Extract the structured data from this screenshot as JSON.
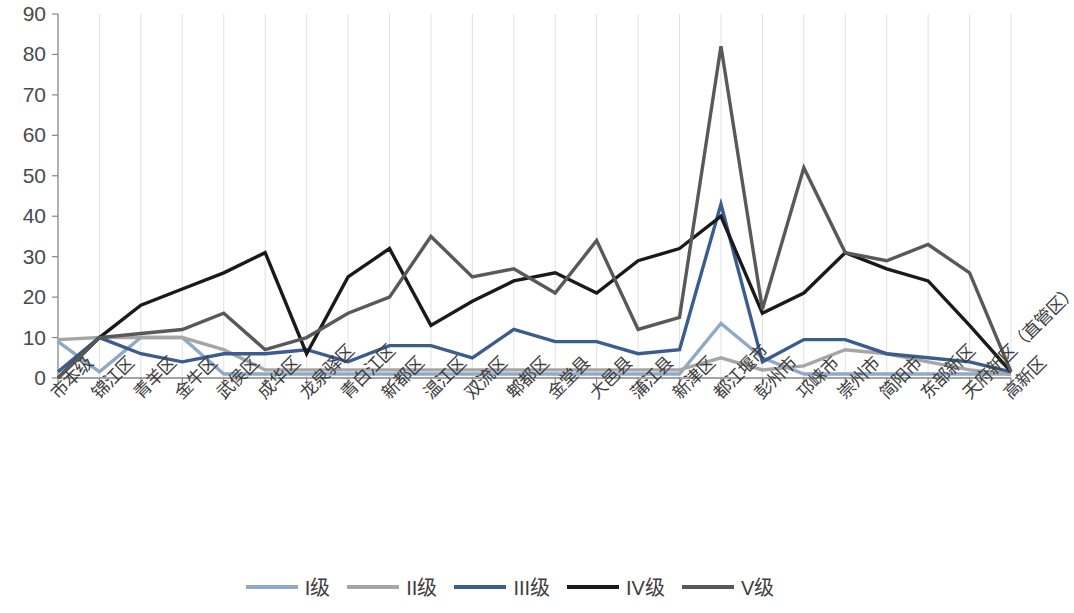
{
  "chart_data": {
    "type": "line",
    "title": "",
    "xlabel": "",
    "ylabel": "",
    "ylim": [
      0,
      90
    ],
    "yticks": [
      0,
      10,
      20,
      30,
      40,
      50,
      60,
      70,
      80,
      90
    ],
    "grid": "vertical-only",
    "legend_position": "bottom",
    "categories": [
      "市本级",
      "锦江区",
      "青羊区",
      "金牛区",
      "武侯区",
      "成华区",
      "龙泉驿区",
      "青白江区",
      "新都区",
      "温江区",
      "双流区",
      "郫都区",
      "金堂县",
      "大邑县",
      "蒲江县",
      "新津区",
      "都江堰市",
      "彭州市",
      "邛崃市",
      "崇州市",
      "简阳市",
      "东部新区",
      "天府新区（直管区）",
      "高新区"
    ],
    "series": [
      {
        "name": "I级",
        "color": "#8FA9C9",
        "values": [
          9,
          1.5,
          10,
          10,
          1,
          1,
          1,
          1,
          1,
          1,
          1,
          1,
          1,
          1,
          1,
          1,
          13.5,
          5,
          1,
          1,
          1,
          1,
          1,
          1
        ]
      },
      {
        "name": "II级",
        "color": "#A6A6A6",
        "values": [
          9.5,
          10,
          10,
          10,
          7,
          2,
          2,
          2,
          2,
          2,
          2,
          2,
          2,
          2,
          2,
          2,
          5,
          2,
          3,
          7,
          6,
          4,
          2,
          1
        ]
      },
      {
        "name": "III级",
        "color": "#3B5C8F",
        "values": [
          1.5,
          10,
          6,
          4,
          6,
          6,
          7,
          4,
          8,
          8,
          5,
          12,
          9,
          9,
          6,
          7,
          43,
          4,
          9.5,
          9.5,
          6,
          5,
          4,
          1.5
        ]
      },
      {
        "name": "IV级",
        "color": "#1A1A1A",
        "values": [
          0,
          10,
          18,
          22,
          26,
          31,
          6,
          25,
          32,
          13,
          19,
          24,
          26,
          21,
          29,
          32,
          40,
          16,
          21,
          31,
          27,
          24,
          13,
          1.5
        ]
      },
      {
        "name": "V级",
        "color": "#595959",
        "values": [
          0,
          10,
          11,
          12,
          16,
          7,
          10,
          16,
          20,
          35,
          25,
          27,
          21,
          34,
          12,
          15,
          82,
          17,
          52,
          31,
          29,
          33,
          26,
          1.5
        ]
      }
    ]
  },
  "axes": {
    "y_tick_labels": [
      "0",
      "10",
      "20",
      "30",
      "40",
      "50",
      "60",
      "70",
      "80",
      "90"
    ]
  },
  "legend": {
    "items": [
      {
        "label": "I级",
        "color": "#8FA9C9"
      },
      {
        "label": "II级",
        "color": "#A6A6A6"
      },
      {
        "label": "III级",
        "color": "#3B5C8F"
      },
      {
        "label": "IV级",
        "color": "#1A1A1A"
      },
      {
        "label": "V级",
        "color": "#595959"
      }
    ]
  }
}
